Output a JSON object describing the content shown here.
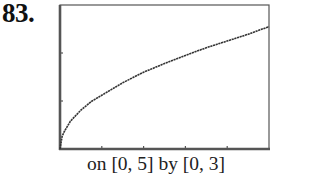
{
  "problem_number": "83.",
  "caption": "on [0, 5] by [0, 3]",
  "colors": {
    "frame": "#555555",
    "curve": "#333333",
    "text": "#111111"
  },
  "chart_data": {
    "type": "line",
    "title": "",
    "xlabel": "",
    "ylabel": "",
    "xlim": [
      0,
      5
    ],
    "ylim": [
      0,
      3
    ],
    "x_ticks": [
      0,
      1,
      2,
      3,
      4,
      5
    ],
    "y_ticks": [
      0,
      1,
      2,
      3
    ],
    "grid": false,
    "legend": null,
    "window_caption": "on [0, 5] by [0, 3]",
    "series": [
      {
        "name": "curve",
        "x": [
          0,
          0.05,
          0.1,
          0.25,
          0.5,
          0.75,
          1,
          1.5,
          2,
          2.5,
          3,
          3.5,
          4,
          4.5,
          5
        ],
        "y": [
          0,
          0.26,
          0.36,
          0.58,
          0.81,
          0.99,
          1.12,
          1.38,
          1.6,
          1.78,
          1.95,
          2.11,
          2.25,
          2.39,
          2.55
        ]
      }
    ]
  }
}
